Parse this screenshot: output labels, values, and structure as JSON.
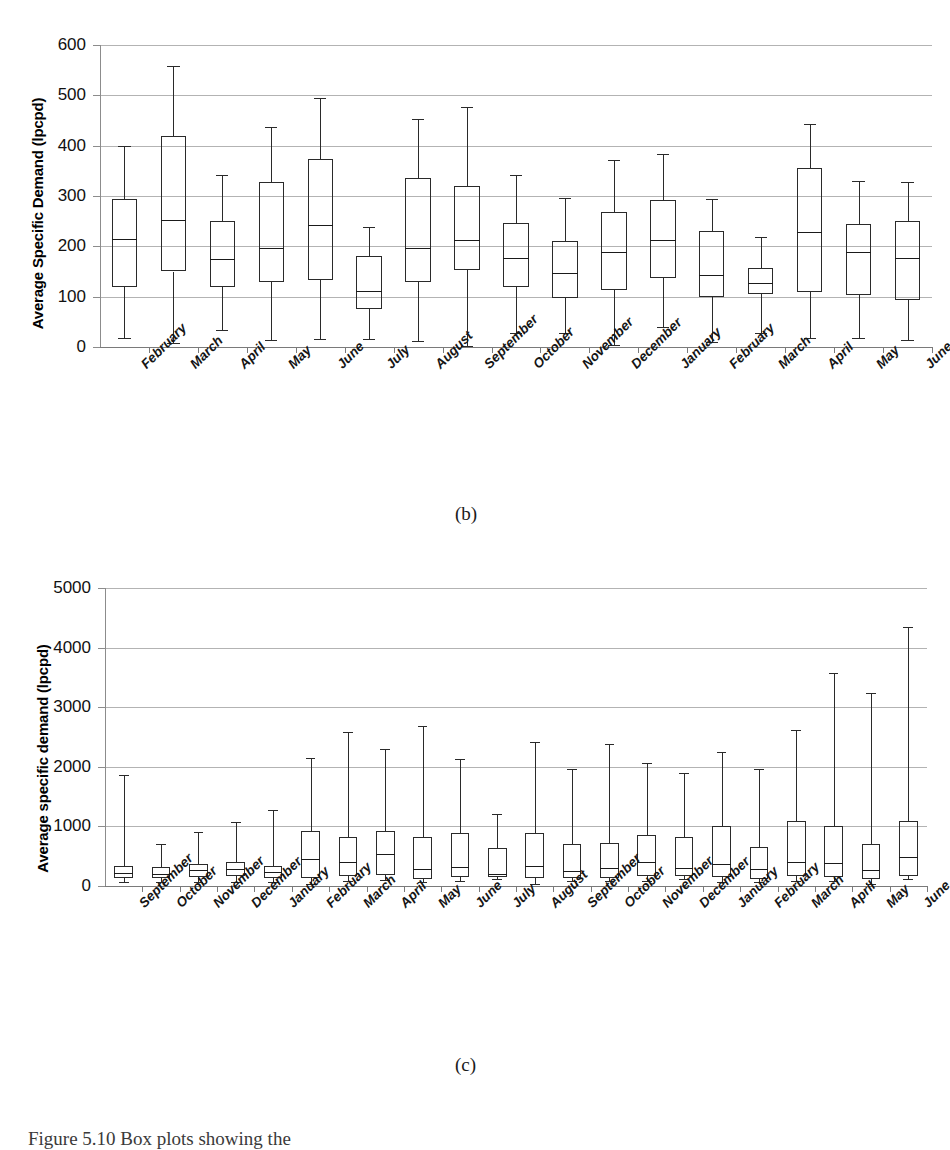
{
  "page": {
    "caption": "Figure 5.10 Box plots showing the"
  },
  "panels": [
    {
      "letter": "(b)",
      "chart_data": {
        "type": "box",
        "title": "",
        "xlabel": "",
        "ylabel": "Average Specific Demand (lpcpd)",
        "ylim": [
          0,
          600
        ],
        "yticks": [
          0,
          100,
          200,
          300,
          400,
          500,
          600
        ],
        "grid": true,
        "legend": "none",
        "categories": [
          "February",
          "March",
          "April",
          "May",
          "June",
          "July",
          "August",
          "September",
          "October",
          "November",
          "December",
          "January",
          "February",
          "March",
          "April",
          "May",
          "June"
        ],
        "boxes": [
          {
            "label": "February",
            "min": 18,
            "q1": 120,
            "median": 215,
            "q3": 295,
            "max": 400
          },
          {
            "label": "March",
            "min": 8,
            "q1": 150,
            "median": 252,
            "q3": 419,
            "max": 558
          },
          {
            "label": "April",
            "min": 33,
            "q1": 120,
            "median": 175,
            "q3": 251,
            "max": 341
          },
          {
            "label": "May",
            "min": 13,
            "q1": 130,
            "median": 197,
            "q3": 327,
            "max": 438
          },
          {
            "label": "June",
            "min": 15,
            "q1": 133,
            "median": 242,
            "q3": 374,
            "max": 494
          },
          {
            "label": "July",
            "min": 15,
            "q1": 75,
            "median": 111,
            "q3": 181,
            "max": 238
          },
          {
            "label": "August",
            "min": 11,
            "q1": 130,
            "median": 196,
            "q3": 336,
            "max": 452
          },
          {
            "label": "September",
            "min": 2,
            "q1": 152,
            "median": 212,
            "q3": 320,
            "max": 477
          },
          {
            "label": "October",
            "min": 27,
            "q1": 120,
            "median": 176,
            "q3": 247,
            "max": 341
          },
          {
            "label": "November",
            "min": 27,
            "q1": 98,
            "median": 148,
            "q3": 210,
            "max": 297
          },
          {
            "label": "December",
            "min": 3,
            "q1": 113,
            "median": 188,
            "q3": 268,
            "max": 372
          },
          {
            "label": "January",
            "min": 40,
            "q1": 137,
            "median": 213,
            "q3": 293,
            "max": 383
          },
          {
            "label": "February",
            "min": 10,
            "q1": 100,
            "median": 143,
            "q3": 230,
            "max": 295
          },
          {
            "label": "March",
            "min": 27,
            "q1": 106,
            "median": 127,
            "q3": 156,
            "max": 218
          },
          {
            "label": "April",
            "min": 18,
            "q1": 110,
            "median": 229,
            "q3": 356,
            "max": 443
          },
          {
            "label": "May",
            "min": 17,
            "q1": 104,
            "median": 188,
            "q3": 244,
            "max": 330
          },
          {
            "label": "June",
            "min": 13,
            "q1": 93,
            "median": 176,
            "q3": 251,
            "max": 327
          }
        ]
      }
    },
    {
      "letter": "(c)",
      "chart_data": {
        "type": "box",
        "title": "",
        "xlabel": "",
        "ylabel": "Average specific demand (lpcpd)",
        "ylim": [
          0,
          5000
        ],
        "yticks": [
          0,
          1000,
          2000,
          3000,
          4000,
          5000
        ],
        "grid": true,
        "legend": "none",
        "categories": [
          "September",
          "October",
          "November",
          "December",
          "January",
          "February",
          "March",
          "April",
          "May",
          "June",
          "July",
          "August",
          "September",
          "October",
          "November",
          "December",
          "January",
          "February",
          "March",
          "April",
          "May",
          "June"
        ],
        "boxes": [
          {
            "label": "September",
            "min": 60,
            "q1": 130,
            "median": 210,
            "q3": 330,
            "max": 1870
          },
          {
            "label": "October",
            "min": 70,
            "q1": 140,
            "median": 200,
            "q3": 320,
            "max": 700
          },
          {
            "label": "November",
            "min": 60,
            "q1": 150,
            "median": 270,
            "q3": 370,
            "max": 900
          },
          {
            "label": "December",
            "min": 70,
            "q1": 170,
            "median": 290,
            "q3": 400,
            "max": 1080
          },
          {
            "label": "January",
            "min": 60,
            "q1": 130,
            "median": 240,
            "q3": 330,
            "max": 1270
          },
          {
            "label": "February",
            "min": 30,
            "q1": 140,
            "median": 450,
            "q3": 920,
            "max": 2150
          },
          {
            "label": "March",
            "min": 90,
            "q1": 160,
            "median": 400,
            "q3": 820,
            "max": 2580
          },
          {
            "label": "April",
            "min": 100,
            "q1": 180,
            "median": 530,
            "q3": 930,
            "max": 2300
          },
          {
            "label": "May",
            "min": 60,
            "q1": 120,
            "median": 290,
            "q3": 820,
            "max": 2680
          },
          {
            "label": "June",
            "min": 90,
            "q1": 150,
            "median": 320,
            "q3": 890,
            "max": 2130
          },
          {
            "label": "July",
            "min": 110,
            "q1": 150,
            "median": 200,
            "q3": 640,
            "max": 1200
          },
          {
            "label": "August",
            "min": 40,
            "q1": 130,
            "median": 330,
            "q3": 890,
            "max": 2420
          },
          {
            "label": "September",
            "min": 90,
            "q1": 130,
            "median": 250,
            "q3": 710,
            "max": 1960
          },
          {
            "label": "October",
            "min": 90,
            "q1": 130,
            "median": 300,
            "q3": 720,
            "max": 2390
          },
          {
            "label": "November",
            "min": 90,
            "q1": 170,
            "median": 400,
            "q3": 860,
            "max": 2070
          },
          {
            "label": "December",
            "min": 110,
            "q1": 160,
            "median": 310,
            "q3": 820,
            "max": 1900
          },
          {
            "label": "January",
            "min": 70,
            "q1": 150,
            "median": 370,
            "q3": 1010,
            "max": 2250
          },
          {
            "label": "February",
            "min": 60,
            "q1": 120,
            "median": 280,
            "q3": 650,
            "max": 1960
          },
          {
            "label": "March",
            "min": 80,
            "q1": 160,
            "median": 410,
            "q3": 1090,
            "max": 2620
          },
          {
            "label": "April",
            "min": 90,
            "q1": 150,
            "median": 390,
            "q3": 1000,
            "max": 3580
          },
          {
            "label": "May",
            "min": 40,
            "q1": 120,
            "median": 270,
            "q3": 710,
            "max": 3240
          },
          {
            "label": "June",
            "min": 110,
            "q1": 170,
            "median": 480,
            "q3": 1090,
            "max": 4340
          }
        ]
      }
    }
  ]
}
